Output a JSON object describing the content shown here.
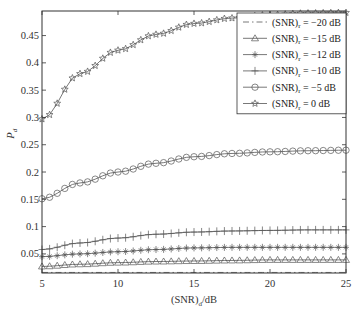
{
  "chart_data": {
    "type": "line",
    "title": "",
    "xlabel": "(SNR)_d/dB",
    "xlabel_main": "(SNR)",
    "xlabel_sub": "d",
    "xlabel_suffix": "/dB",
    "ylabel": "P_d",
    "ylabel_main": "P",
    "ylabel_sub": "d",
    "xlim": [
      5,
      25
    ],
    "ylim": [
      0.015,
      0.495
    ],
    "xticks": [
      5,
      10,
      15,
      20,
      25
    ],
    "xtick_labels": [
      "5",
      "10",
      "15",
      "20",
      "25"
    ],
    "yticks": [
      0.05,
      0.1,
      0.15,
      0.2,
      0.25,
      0.3,
      0.35,
      0.4,
      0.45
    ],
    "ytick_labels": [
      "0.05",
      "0.1",
      "0.15",
      "0.2",
      "0.25",
      "0.3",
      "0.35",
      "0.4",
      "0.45"
    ],
    "grid": false,
    "legend_position": "top-right",
    "x": [
      5,
      7.5,
      10,
      12.5,
      15,
      17.5,
      20,
      22.5,
      25
    ],
    "series": [
      {
        "name": "(SNR)r = -20 dB",
        "label_main": "(SNR)",
        "label_sub": "r",
        "label_suffix": " = −20 dB",
        "marker": "none",
        "line": "dashdot",
        "values": [
          0.016,
          0.016,
          0.016,
          0.016,
          0.016,
          0.016,
          0.016,
          0.016,
          0.016
        ]
      },
      {
        "name": "(SNR)r = -15 dB",
        "label_main": "(SNR)",
        "label_sub": "r",
        "label_suffix": " = −15 dB",
        "marker": "triangle",
        "line": "solid",
        "values": [
          0.027,
          0.031,
          0.034,
          0.036,
          0.037,
          0.038,
          0.039,
          0.039,
          0.039
        ]
      },
      {
        "name": "(SNR)r = -12 dB",
        "label_main": "(SNR)",
        "label_sub": "r",
        "label_suffix": " = −12 dB",
        "marker": "asterisk",
        "line": "solid",
        "values": [
          0.045,
          0.05,
          0.054,
          0.058,
          0.061,
          0.062,
          0.062,
          0.062,
          0.062
        ]
      },
      {
        "name": "(SNR)r = -10 dB",
        "label_main": "(SNR)",
        "label_sub": "r",
        "label_suffix": " = −10 dB",
        "marker": "plus",
        "line": "solid",
        "values": [
          0.058,
          0.07,
          0.079,
          0.086,
          0.09,
          0.092,
          0.093,
          0.094,
          0.094
        ]
      },
      {
        "name": "(SNR)r = -5 dB",
        "label_main": "(SNR)",
        "label_sub": "r",
        "label_suffix": " = −5 dB",
        "marker": "circle",
        "line": "solid",
        "values": [
          0.151,
          0.18,
          0.2,
          0.216,
          0.228,
          0.234,
          0.237,
          0.239,
          0.24
        ]
      },
      {
        "name": "(SNR)r = 0 dB",
        "label_main": "(SNR)",
        "label_sub": "r",
        "label_suffix": " = 0 dB",
        "marker": "star",
        "line": "solid",
        "values": [
          0.297,
          0.38,
          0.423,
          0.452,
          0.472,
          0.482,
          0.488,
          0.491,
          0.492
        ]
      }
    ]
  }
}
